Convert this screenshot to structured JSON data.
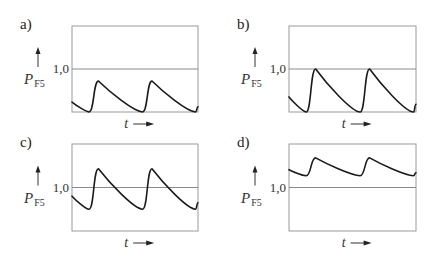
{
  "chart_data": [
    {
      "type": "line",
      "panel": "a)",
      "ylabel": "P",
      "ylabel_sub": "F5",
      "xlabel": "t",
      "ref_value": 1.0,
      "ref_label": "1,0",
      "ylim": [
        0,
        2
      ],
      "xlim": [
        0,
        1
      ],
      "series": [
        {
          "name": "P_F5",
          "points": [
            [
              0,
              0.23
            ],
            [
              0.135,
              0.0
            ],
            [
              0.21,
              0.72
            ],
            [
              0.56,
              0.0
            ],
            [
              0.635,
              0.72
            ],
            [
              0.98,
              0.0
            ],
            [
              1.0,
              0.12
            ]
          ]
        }
      ]
    },
    {
      "type": "line",
      "panel": "b)",
      "ylabel": "P",
      "ylabel_sub": "F5",
      "xlabel": "t",
      "ref_value": 1.0,
      "ref_label": "1,0",
      "ylim": [
        0,
        2
      ],
      "xlim": [
        0,
        1
      ],
      "series": [
        {
          "name": "P_F5",
          "points": [
            [
              0,
              0.35
            ],
            [
              0.135,
              0.0
            ],
            [
              0.21,
              1.0
            ],
            [
              0.56,
              0.0
            ],
            [
              0.635,
              1.0
            ],
            [
              0.98,
              0.0
            ],
            [
              1.0,
              0.18
            ]
          ]
        }
      ]
    },
    {
      "type": "line",
      "panel": "c)",
      "ylabel": "P",
      "ylabel_sub": "F5",
      "xlabel": "t",
      "ref_value": 1.0,
      "ref_label": "1,0",
      "ylim": [
        0,
        2
      ],
      "xlim": [
        0,
        1
      ],
      "series": [
        {
          "name": "P_F5",
          "points": [
            [
              0,
              0.8
            ],
            [
              0.135,
              0.5
            ],
            [
              0.21,
              1.43
            ],
            [
              0.56,
              0.5
            ],
            [
              0.635,
              1.43
            ],
            [
              0.98,
              0.5
            ],
            [
              1.0,
              0.65
            ]
          ]
        }
      ]
    },
    {
      "type": "line",
      "panel": "d)",
      "ylabel": "P",
      "ylabel_sub": "F5",
      "xlabel": "t",
      "ref_value": 1.0,
      "ref_label": "1,0",
      "ylim": [
        0,
        2
      ],
      "xlim": [
        0,
        1
      ],
      "series": [
        {
          "name": "P_F5",
          "points": [
            [
              0,
              1.41
            ],
            [
              0.135,
              1.27
            ],
            [
              0.21,
              1.68
            ],
            [
              0.56,
              1.27
            ],
            [
              0.635,
              1.68
            ],
            [
              0.98,
              1.27
            ],
            [
              1.0,
              1.34
            ]
          ]
        }
      ]
    }
  ]
}
